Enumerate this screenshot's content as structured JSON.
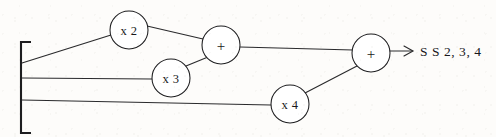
{
  "diagram": {
    "type": "signal-flow-block-diagram",
    "background_color": "#fdfcfa",
    "stroke_color": "#1d1d1f",
    "input_bus": {
      "name": "input-bracket",
      "tap_count": 3
    },
    "nodes": [
      {
        "id": "gain-x2",
        "label": "x 2",
        "kind": "gain",
        "cx": 129,
        "cy": 30,
        "r": 19
      },
      {
        "id": "sum-1",
        "label": "+",
        "kind": "summer",
        "cx": 221,
        "cy": 45,
        "r": 19
      },
      {
        "id": "gain-x3",
        "label": "x 3",
        "kind": "gain",
        "cx": 171,
        "cy": 78,
        "r": 19
      },
      {
        "id": "gain-x4",
        "label": "x 4",
        "kind": "gain",
        "cx": 290,
        "cy": 104,
        "r": 19
      },
      {
        "id": "sum-2",
        "label": "+",
        "kind": "summer",
        "cx": 371,
        "cy": 53,
        "r": 19
      }
    ],
    "output": {
      "label": "S S 2, 3, 4",
      "arrow": "right-arrow"
    }
  }
}
